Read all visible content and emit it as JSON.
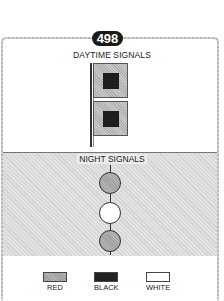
{
  "badge": {
    "number": "498"
  },
  "day_section": {
    "title": "DAYTIME SIGNALS",
    "flags": [
      {
        "outer": "red",
        "inner": "black"
      },
      {
        "outer": "red",
        "inner": "black"
      }
    ]
  },
  "night_section": {
    "title": "NIGHT SIGNALS",
    "lights": [
      "red",
      "white",
      "red"
    ]
  },
  "legend": {
    "items": [
      {
        "label": "RED",
        "color": "#a8a8a8"
      },
      {
        "label": "BLACK",
        "color": "#222222"
      },
      {
        "label": "WHITE",
        "color": "#ffffff"
      }
    ]
  }
}
